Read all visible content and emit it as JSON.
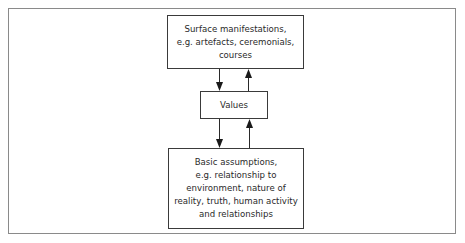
{
  "diagram": {
    "type": "layered cultural model",
    "nodes": [
      {
        "id": "surface",
        "lines": [
          "Surface manifestations,",
          "e.g. artefacts, ceremonials,",
          "courses"
        ]
      },
      {
        "id": "values",
        "lines": [
          "Values"
        ]
      },
      {
        "id": "assumptions",
        "lines": [
          "Basic assumptions,",
          "e.g. relationship to",
          "environment, nature of",
          "reality, truth, human activity",
          "and relationships"
        ]
      }
    ],
    "edges": [
      {
        "from": "surface",
        "to": "values",
        "direction": "down"
      },
      {
        "from": "values",
        "to": "surface",
        "direction": "up"
      },
      {
        "from": "values",
        "to": "assumptions",
        "direction": "down"
      },
      {
        "from": "assumptions",
        "to": "values",
        "direction": "up"
      }
    ],
    "colors": {
      "stroke": "#3a3a3a",
      "frame": "#8a8a8a",
      "background": "#ffffff"
    }
  }
}
